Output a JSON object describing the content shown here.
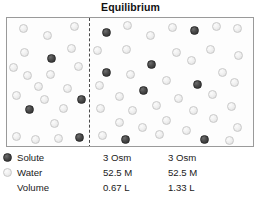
{
  "title": "Equilibrium",
  "chart_data": {
    "type": "diagram",
    "title": "Equilibrium",
    "compartments": [
      {
        "side": "left",
        "solute": "3 Osm",
        "water": "52.5 M",
        "volume": "0.67 L",
        "solute_particle_count": 4,
        "water_particle_count": 20
      },
      {
        "side": "right",
        "solute": "3 Osm",
        "water": "52.5 M",
        "volume": "1.33 L",
        "solute_particle_count": 8,
        "water_particle_count": 40
      }
    ],
    "legend": [
      "Solute",
      "Water",
      "Volume"
    ],
    "membrane": "dashed vertical line"
  },
  "legend": {
    "rows": [
      {
        "label": "Solute",
        "swatch": "dark-filled-circle",
        "left": "3 Osm",
        "right": "3 Osm"
      },
      {
        "label": "Water",
        "swatch": "light-open-circle",
        "left": "52.5 M",
        "right": "52.5 M"
      },
      {
        "label": "Volume",
        "swatch": "none",
        "left": "0.67 L",
        "right": "1.33 L"
      }
    ]
  },
  "colors": {
    "solute": "#3a3a3a",
    "water": "#ededed",
    "box_border": "#9a9a9a",
    "membrane": "#4a4a4a",
    "text": "#1a1a1a"
  },
  "particles": {
    "left": [
      {
        "x": 12,
        "y": 6,
        "type": "water"
      },
      {
        "x": 36,
        "y": 13,
        "type": "water"
      },
      {
        "x": 63,
        "y": 4,
        "type": "water"
      },
      {
        "x": 60,
        "y": 26,
        "type": "water"
      },
      {
        "x": 13,
        "y": 30,
        "type": "water"
      },
      {
        "x": 40,
        "y": 36,
        "type": "solute"
      },
      {
        "x": 67,
        "y": 44,
        "type": "water"
      },
      {
        "x": 16,
        "y": 53,
        "type": "water"
      },
      {
        "x": 39,
        "y": 52,
        "type": "water"
      },
      {
        "x": 56,
        "y": 66,
        "type": "water"
      },
      {
        "x": 27,
        "y": 64,
        "type": "water"
      },
      {
        "x": 5,
        "y": 73,
        "type": "water"
      },
      {
        "x": 33,
        "y": 77,
        "type": "water"
      },
      {
        "x": 18,
        "y": 87,
        "type": "solute"
      },
      {
        "x": 52,
        "y": 86,
        "type": "water"
      },
      {
        "x": 70,
        "y": 77,
        "type": "solute"
      },
      {
        "x": 43,
        "y": 101,
        "type": "water"
      },
      {
        "x": 5,
        "y": 114,
        "type": "water"
      },
      {
        "x": 24,
        "y": 117,
        "type": "water"
      },
      {
        "x": 68,
        "y": 115,
        "type": "solute"
      },
      {
        "x": 47,
        "y": 116,
        "type": "water"
      },
      {
        "x": 2,
        "y": 45,
        "type": "water"
      }
    ],
    "right": [
      {
        "x": 12,
        "y": 10,
        "type": "solute"
      },
      {
        "x": 33,
        "y": 3,
        "type": "water"
      },
      {
        "x": 56,
        "y": 13,
        "type": "water"
      },
      {
        "x": 78,
        "y": 5,
        "type": "water"
      },
      {
        "x": 100,
        "y": 8,
        "type": "solute"
      },
      {
        "x": 122,
        "y": 4,
        "type": "water"
      },
      {
        "x": 143,
        "y": 6,
        "type": "water"
      },
      {
        "x": 3,
        "y": 28,
        "type": "water"
      },
      {
        "x": 32,
        "y": 27,
        "type": "water"
      },
      {
        "x": 82,
        "y": 30,
        "type": "water"
      },
      {
        "x": 116,
        "y": 27,
        "type": "water"
      },
      {
        "x": 144,
        "y": 33,
        "type": "water"
      },
      {
        "x": 57,
        "y": 42,
        "type": "solute"
      },
      {
        "x": 97,
        "y": 38,
        "type": "water"
      },
      {
        "x": 12,
        "y": 50,
        "type": "solute"
      },
      {
        "x": 36,
        "y": 52,
        "type": "water"
      },
      {
        "x": 128,
        "y": 50,
        "type": "water"
      },
      {
        "x": 72,
        "y": 58,
        "type": "water"
      },
      {
        "x": 103,
        "y": 62,
        "type": "solute"
      },
      {
        "x": 5,
        "y": 63,
        "type": "water"
      },
      {
        "x": 49,
        "y": 68,
        "type": "solute"
      },
      {
        "x": 140,
        "y": 60,
        "type": "water"
      },
      {
        "x": 25,
        "y": 74,
        "type": "water"
      },
      {
        "x": 84,
        "y": 76,
        "type": "water"
      },
      {
        "x": 118,
        "y": 72,
        "type": "water"
      },
      {
        "x": 62,
        "y": 83,
        "type": "water"
      },
      {
        "x": 6,
        "y": 86,
        "type": "water"
      },
      {
        "x": 38,
        "y": 88,
        "type": "water"
      },
      {
        "x": 99,
        "y": 88,
        "type": "water"
      },
      {
        "x": 137,
        "y": 84,
        "type": "water"
      },
      {
        "x": 72,
        "y": 98,
        "type": "water"
      },
      {
        "x": 25,
        "y": 100,
        "type": "water"
      },
      {
        "x": 119,
        "y": 96,
        "type": "water"
      },
      {
        "x": 48,
        "y": 105,
        "type": "water"
      },
      {
        "x": 143,
        "y": 105,
        "type": "water"
      },
      {
        "x": 92,
        "y": 108,
        "type": "water"
      },
      {
        "x": 8,
        "y": 113,
        "type": "water"
      },
      {
        "x": 31,
        "y": 117,
        "type": "solute"
      },
      {
        "x": 65,
        "y": 112,
        "type": "water"
      },
      {
        "x": 110,
        "y": 117,
        "type": "solute"
      },
      {
        "x": 135,
        "y": 118,
        "type": "water"
      }
    ]
  }
}
